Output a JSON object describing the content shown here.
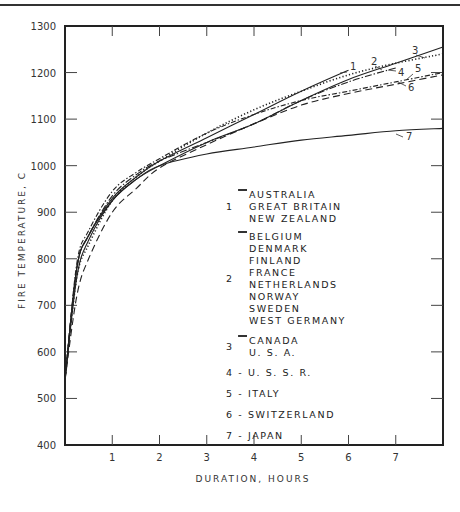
{
  "chart_data": {
    "type": "line",
    "title": "",
    "xlabel": "DURATION, HOURS",
    "ylabel": "FIRE TEMPERATURE, C",
    "xlim": [
      0,
      8
    ],
    "ylim": [
      400,
      1300
    ],
    "x_ticks": [
      1,
      2,
      3,
      4,
      5,
      6,
      7
    ],
    "y_ticks": [
      400,
      500,
      600,
      700,
      800,
      900,
      1000,
      1100,
      1200,
      1300
    ],
    "x_tick_labels": [
      "1",
      "2",
      "3",
      "4",
      "5",
      "6",
      "7"
    ],
    "y_tick_labels": [
      "400",
      "500",
      "600",
      "700",
      "800",
      "900",
      "1000",
      "1100",
      "1200",
      "1300"
    ],
    "grid": false,
    "legend_position": "inside center-right",
    "series": [
      {
        "id": "1",
        "name": "AUSTRALIA, GREAT BRITAIN, NEW ZEALAND",
        "style": "solid",
        "x": [
          0.0,
          0.25,
          0.5,
          1.0,
          1.5,
          2.0,
          3.0,
          4.0,
          5.0,
          6.0
        ],
        "y": [
          540,
          780,
          850,
          930,
          975,
          1010,
          1060,
          1110,
          1160,
          1205
        ]
      },
      {
        "id": "2",
        "name": "BELGIUM, DENMARK, FINLAND, FRANCE, NETHERLANDS, NORWAY, SWEDEN, WEST GERMANY",
        "style": "dotted",
        "x": [
          0.0,
          0.25,
          0.5,
          1.0,
          1.5,
          2.0,
          3.0,
          4.0,
          5.0,
          6.0,
          7.0,
          8.0
        ],
        "y": [
          540,
          760,
          830,
          925,
          975,
          1010,
          1070,
          1120,
          1160,
          1195,
          1220,
          1240
        ]
      },
      {
        "id": "3",
        "name": "CANADA, U.S.A.",
        "style": "solid-thin",
        "x": [
          0.0,
          0.25,
          0.5,
          1.0,
          1.5,
          2.0,
          3.0,
          4.0,
          5.0,
          6.0,
          7.0,
          8.0
        ],
        "y": [
          540,
          760,
          840,
          925,
          970,
          1000,
          1050,
          1090,
          1140,
          1185,
          1220,
          1255
        ]
      },
      {
        "id": "4",
        "name": "U.S.S.R.",
        "style": "dash-dot",
        "x": [
          0.0,
          0.25,
          0.5,
          1.0,
          1.5,
          2.0,
          3.0,
          4.0,
          5.0,
          6.0,
          7.0
        ],
        "y": [
          540,
          780,
          850,
          935,
          980,
          1010,
          1050,
          1090,
          1140,
          1180,
          1210
        ]
      },
      {
        "id": "5",
        "name": "ITALY",
        "style": "dashed-dot",
        "x": [
          0.0,
          0.25,
          0.5,
          1.0,
          1.5,
          2.0,
          3.0,
          4.0,
          5.0,
          6.0,
          7.0,
          8.0
        ],
        "y": [
          540,
          790,
          860,
          945,
          985,
          1015,
          1070,
          1110,
          1140,
          1160,
          1180,
          1200
        ]
      },
      {
        "id": "6",
        "name": "SWITZERLAND",
        "style": "long-dash",
        "x": [
          0.0,
          0.25,
          0.5,
          1.0,
          1.5,
          2.0,
          3.0,
          4.0,
          5.0,
          6.0,
          7.0,
          8.0
        ],
        "y": [
          540,
          720,
          800,
          900,
          950,
          995,
          1045,
          1090,
          1130,
          1155,
          1175,
          1195
        ]
      },
      {
        "id": "7",
        "name": "JAPAN",
        "style": "solid",
        "x": [
          0.0,
          0.25,
          0.5,
          1.0,
          1.5,
          2.0,
          3.0,
          4.0,
          5.0,
          6.0,
          7.0,
          8.0
        ],
        "y": [
          540,
          780,
          850,
          925,
          970,
          1000,
          1025,
          1040,
          1055,
          1065,
          1075,
          1080
        ]
      }
    ],
    "annotations": [
      "1",
      "2",
      "3",
      "4",
      "5",
      "6",
      "7"
    ]
  },
  "axes": {
    "xlabel": "DURATION, HOURS",
    "ylabel": "FIRE TEMPERATURE, C"
  },
  "legend": {
    "groups": [
      {
        "num": "1",
        "names": [
          "AUSTRALIA",
          "GREAT BRITAIN",
          "NEW ZEALAND"
        ]
      },
      {
        "num": "2",
        "names": [
          "BELGIUM",
          "DENMARK",
          "FINLAND",
          "FRANCE",
          "NETHERLANDS",
          "NORWAY",
          "SWEDEN",
          "WEST GERMANY"
        ]
      },
      {
        "num": "3",
        "names": [
          "CANADA",
          "U. S. A."
        ]
      }
    ],
    "singles": [
      {
        "text": "4 - U. S. S. R."
      },
      {
        "text": "5 - ITALY"
      },
      {
        "text": "6 - SWITZERLAND"
      },
      {
        "text": "7 - JAPAN"
      }
    ]
  },
  "curve_labels": [
    "1",
    "2",
    "3",
    "4",
    "5",
    "6",
    "7"
  ]
}
